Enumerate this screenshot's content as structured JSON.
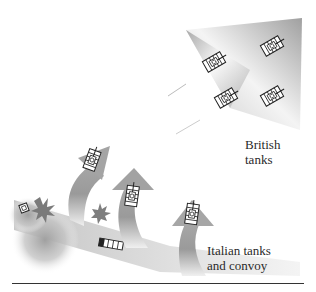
{
  "diagram": {
    "type": "battle-map-illustration",
    "labels": {
      "british": [
        "British",
        "tanks"
      ],
      "italian": [
        "Italian tanks",
        "and convoy"
      ]
    },
    "elements": {
      "british_formation": {
        "description": "gray arrowhead wedge pointing upper-right",
        "tank_count": 4
      },
      "italian_arrows": {
        "description": "three curved gray arrows sweeping up from the convoy road",
        "count": 3,
        "tanks_on_arrows": 3
      },
      "convoy_road": {
        "description": "diagonal gray band from left descending right"
      },
      "explosions": 2,
      "convoy_vehicles": 2
    },
    "colors": {
      "arrow_gray": "#9a9a9a",
      "wedge_gray": "#b0b0b0",
      "smoke_gray": "#a8a8a8",
      "text": "#2a2a2a",
      "rule": "#333333"
    }
  }
}
